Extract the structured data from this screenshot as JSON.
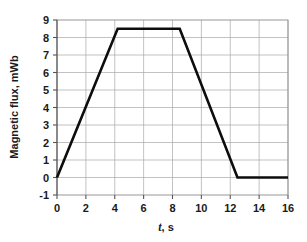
{
  "chart_data": {
    "type": "line",
    "title": "",
    "xlabel": "t, s",
    "xlabel_italic_part": "t",
    "xlabel_rest": ", s",
    "ylabel": "Magnetic flux, mWb",
    "xlim": [
      0,
      16
    ],
    "ylim": [
      -1,
      9
    ],
    "grid": true,
    "legend": "none",
    "xticks": [
      0,
      2,
      4,
      6,
      8,
      10,
      12,
      14,
      16
    ],
    "xtick_labels": [
      "0",
      "2",
      "4",
      "6",
      "8",
      "10",
      "12",
      "14",
      "16"
    ],
    "yticks": [
      -1,
      0,
      1,
      2,
      3,
      4,
      5,
      6,
      7,
      8,
      9
    ],
    "ytick_labels": [
      "-1",
      "0",
      "1",
      "2",
      "3",
      "4",
      "5",
      "6",
      "7",
      "8",
      "9"
    ],
    "x_minor_gridstep": 2,
    "y_minor_gridstep": 1,
    "series": [
      {
        "name": "Magnetic flux",
        "color": "#0d0d0d",
        "x": [
          0,
          4.2,
          8.5,
          12.5,
          16
        ],
        "y": [
          0,
          8.5,
          8.5,
          0,
          0
        ]
      }
    ],
    "annotations": []
  }
}
